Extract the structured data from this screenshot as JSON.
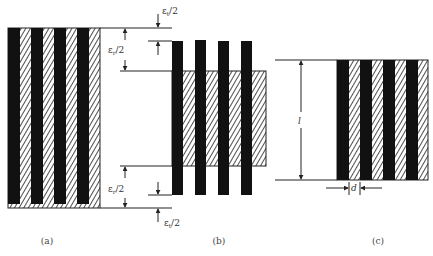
{
  "figure": {
    "panels": [
      {
        "id": "a",
        "caption": "(a)"
      },
      {
        "id": "b",
        "caption": "(b)"
      },
      {
        "id": "c",
        "caption": "(c)"
      }
    ],
    "dimensions": {
      "outer_top": {
        "symbol": "ε",
        "subscript": "t",
        "suffix": "/2"
      },
      "inner_top": {
        "symbol": "ε",
        "subscript": "r",
        "suffix": "/2"
      },
      "inner_bottom": {
        "symbol": "ε",
        "subscript": "r",
        "suffix": "/2"
      },
      "outer_bottom": {
        "symbol": "ε",
        "subscript": "t",
        "suffix": "/2"
      },
      "length": "l",
      "spacing": "d"
    },
    "colors": {
      "solid": "#111111",
      "hatch_fg": "#222222",
      "hatch_bg": "#ffffff",
      "line": "#222222"
    }
  }
}
